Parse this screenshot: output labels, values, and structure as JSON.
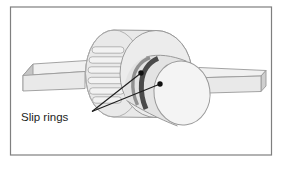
{
  "figure": {
    "label": "Slip rings"
  },
  "colors": {
    "frame_border": "#7f7f7f",
    "block_top": "#f1f1f1",
    "block_front": "#e9e9e9",
    "block_side": "#c6c6c6",
    "block_end": "#cfcfcf",
    "cylinder_body": "#e9e9e9",
    "cylinder_face": "#ececec",
    "winding_slat": "#f2f2f2",
    "shaft_body": "#e3e3e3",
    "shaft_face": "#f4f4f4",
    "slip_ring_front": "#4a4a4a",
    "slip_ring_back": "#909090",
    "leader_line": "#1c1c1c",
    "outline": "#999999"
  }
}
